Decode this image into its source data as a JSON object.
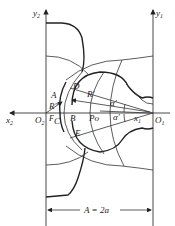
{
  "diagram": {
    "axes": {
      "y2_label": "y",
      "y2_sub": "2",
      "y1_label": "y",
      "y1_sub": "1",
      "x2_label": "x",
      "x2_sub": "2",
      "x1_label": "x",
      "x1_sub": "1",
      "O2_label": "O",
      "O2_sub": "2",
      "O1_label": "O",
      "O1_sub": "1"
    },
    "points": {
      "A": "A",
      "B": "B",
      "C": "C",
      "D": "D",
      "E": "E",
      "F": "F",
      "Po": "Po"
    },
    "radii": {
      "R_double_prime": "R″",
      "R_prime": "R′"
    },
    "angles": {
      "alpha_upper": "α′",
      "alpha_lower": "α′"
    },
    "dimension": {
      "label": "A = 2a"
    }
  }
}
